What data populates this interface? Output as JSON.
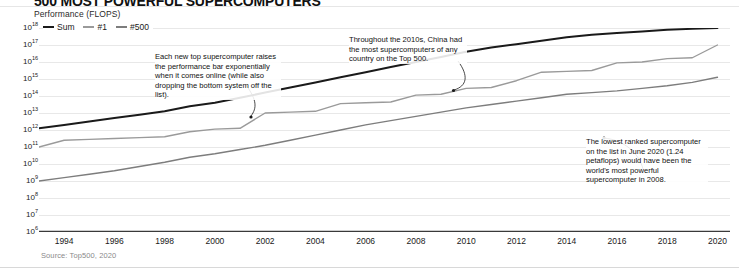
{
  "header": {
    "headline": "500 MOST POWERFUL SUPERCOMPUTERS",
    "y_axis_label": "Performance (FLOPS)",
    "source": "Source: Top500, 2020"
  },
  "colors": {
    "sum": "#1a1a1a",
    "rank1": "#9a9a9a",
    "rank500": "#7d7d7d",
    "grid": "#e8e8e8",
    "axis": "#3a3a3a",
    "annotation_text": "#111111",
    "source_text": "#8a8a8a"
  },
  "chart_data": {
    "type": "line",
    "title": "500 MOST POWERFUL SUPERCOMPUTERS",
    "xlabel": "",
    "ylabel": "Performance (FLOPS)",
    "yscale": "log",
    "ylim": [
      1000000,
      1000000000000000000
    ],
    "xlim": [
      1993,
      2020.5
    ],
    "grid": true,
    "legend_position": "top-left",
    "ytick_labels": [
      "10¹⁸",
      "10¹⁷",
      "10¹⁶",
      "10¹⁵",
      "10¹⁴",
      "10¹³",
      "10¹²",
      "10¹¹",
      "10¹⁰",
      "10⁹",
      "10⁸",
      "10⁷",
      "10⁶"
    ],
    "ytick_exponents": [
      18,
      17,
      16,
      15,
      14,
      13,
      12,
      11,
      10,
      9,
      8,
      7,
      6
    ],
    "xtick_labels": [
      "1994",
      "1996",
      "1998",
      "2000",
      "2002",
      "2004",
      "2006",
      "2008",
      "2010",
      "2012",
      "2014",
      "2016",
      "2018",
      "2020"
    ],
    "xtick_values": [
      1994,
      1996,
      1998,
      2000,
      2002,
      2004,
      2006,
      2008,
      2010,
      2012,
      2014,
      2016,
      2018,
      2020
    ],
    "series": [
      {
        "name": "Sum",
        "color": "#1a1a1a",
        "x": [
          1993,
          1994,
          1995,
          1996,
          1997,
          1998,
          1999,
          2000,
          2001,
          2002,
          2003,
          2004,
          2005,
          2006,
          2007,
          2008,
          2009,
          2010,
          2011,
          2012,
          2013,
          2014,
          2015,
          2016,
          2017,
          2018,
          2019,
          2020
        ],
        "log10_values": [
          12.1,
          12.3,
          12.5,
          12.7,
          12.9,
          13.1,
          13.4,
          13.6,
          13.9,
          14.2,
          14.5,
          14.8,
          15.1,
          15.4,
          15.7,
          16.0,
          16.3,
          16.6,
          16.85,
          17.05,
          17.25,
          17.45,
          17.6,
          17.7,
          17.8,
          17.9,
          17.95,
          18.0
        ]
      },
      {
        "name": "#1",
        "color": "#9a9a9a",
        "x": [
          1993,
          1994,
          1995,
          1996,
          1997,
          1998,
          1999,
          2000,
          2001,
          2002,
          2003,
          2004,
          2005,
          2006,
          2007,
          2008,
          2009,
          2010,
          2011,
          2012,
          2013,
          2014,
          2015,
          2016,
          2017,
          2018,
          2019,
          2020
        ],
        "log10_values": [
          11.0,
          11.4,
          11.45,
          11.5,
          11.55,
          11.6,
          11.9,
          12.05,
          12.1,
          13.0,
          13.05,
          13.1,
          13.55,
          13.6,
          13.65,
          14.05,
          14.1,
          14.45,
          14.5,
          14.9,
          15.4,
          15.45,
          15.5,
          15.95,
          16.0,
          16.2,
          16.25,
          17.0
        ]
      },
      {
        "name": "#500",
        "color": "#7d7d7d",
        "x": [
          1993,
          1994,
          1995,
          1996,
          1997,
          1998,
          1999,
          2000,
          2001,
          2002,
          2003,
          2004,
          2005,
          2006,
          2007,
          2008,
          2009,
          2010,
          2011,
          2012,
          2013,
          2014,
          2015,
          2016,
          2017,
          2018,
          2019,
          2020
        ],
        "log10_values": [
          9.0,
          9.2,
          9.4,
          9.6,
          9.85,
          10.1,
          10.4,
          10.6,
          10.85,
          11.1,
          11.4,
          11.7,
          12.0,
          12.3,
          12.55,
          12.8,
          13.05,
          13.3,
          13.5,
          13.7,
          13.9,
          14.1,
          14.2,
          14.3,
          14.45,
          14.6,
          14.8,
          15.1
        ]
      }
    ],
    "annotations": [
      {
        "id": "annot-0",
        "text": "Each new top supercomputer raises the performance bar exponentially when it comes online (while also dropping the bottom system off the list)."
      },
      {
        "id": "annot-1",
        "text": "Throughout the 2010s, China had the most supercomputers of any country on the Top 500."
      },
      {
        "id": "annot-2",
        "text": "The lowest ranked supercomputer on the list in June 2020 (1.24 petaflops) would have been the world's most powerful supercomputer in 2008."
      }
    ]
  }
}
